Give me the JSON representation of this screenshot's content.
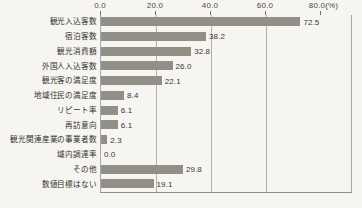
{
  "chart_data": {
    "type": "bar",
    "orientation": "horizontal",
    "title": "",
    "xlabel": "",
    "ylabel": "",
    "unit_label": "(%)",
    "xlim": [
      0,
      80
    ],
    "grid": true,
    "legend": false,
    "axis_ticks": [
      "0.0",
      "20.0",
      "40.0",
      "60.0",
      "80.0"
    ],
    "axis_tick_values": [
      0,
      20,
      40,
      60,
      80
    ],
    "last_tick_suffix": "(%)",
    "last_tick_label": "80.0(%)",
    "categories": [
      "観光入込客数",
      "宿泊客数",
      "観光消費額",
      "外国人入込客数",
      "観光客の満足度",
      "地域住民の満足度",
      "リピート率",
      "再訪意向",
      "観光関連産業の事業者数",
      "域内調達率",
      "その他",
      "数値目標はない"
    ],
    "values": [
      72.5,
      38.2,
      32.8,
      26.0,
      22.1,
      8.4,
      6.1,
      6.1,
      2.3,
      0.0,
      29.8,
      19.1
    ],
    "value_labels": [
      "72.5",
      "38.2",
      "32.8",
      "26.0",
      "22.1",
      "8.4",
      "6.1",
      "6.1",
      "2.3",
      "0.0",
      "29.8",
      "19.1"
    ],
    "bar_color": "#918f86",
    "grid_color": "#b3b2aa",
    "background_color": "#f6f5f1",
    "text_color": "#33332f"
  }
}
